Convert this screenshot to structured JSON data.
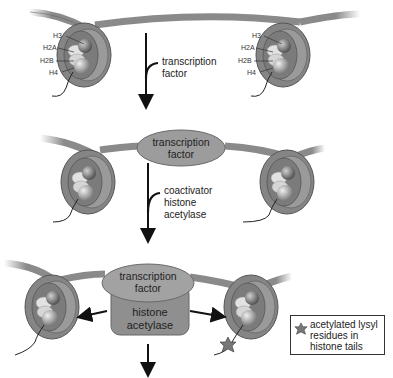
{
  "stage1": {
    "left_nucleosome_labels": [
      "H3",
      "H2A",
      "H2B",
      "H4"
    ],
    "right_nucleosome_labels": [
      "H3",
      "H2A",
      "H2B",
      "H4"
    ],
    "arrow_label_line1": "transcription",
    "arrow_label_line2": "factor"
  },
  "stage2": {
    "oval_line1": "transcription",
    "oval_line2": "factor",
    "arrow_label_line1": "coactivator",
    "arrow_label_line2": "histone",
    "arrow_label_line3": "acetylase"
  },
  "stage3": {
    "oval_line1": "transcription",
    "oval_line2": "factor",
    "block_line1": "histone",
    "block_line2": "acetylase"
  },
  "legend": {
    "icon": "acetyl-star-icon",
    "line1": "acetylated lysyl",
    "line2": "residues in",
    "line3": "histone tails"
  },
  "colors": {
    "dna": "#8a8a8a",
    "nucleosome_ring": "#7d7d7d",
    "protein": "#9a9a9a",
    "background": "#ffffff"
  }
}
